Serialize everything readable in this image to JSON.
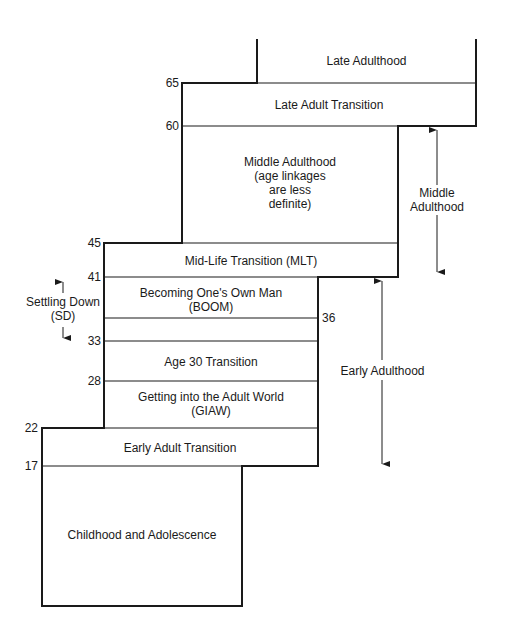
{
  "diagram": {
    "ages": {
      "a65": "65",
      "a60": "60",
      "a45": "45",
      "a41": "41",
      "a36": "36",
      "a33": "33",
      "a28": "28",
      "a22": "22",
      "a17": "17"
    },
    "periods": {
      "late_adulthood": "Late Adulthood",
      "late_adult_transition": "Late Adult Transition",
      "middle_adulthood_l1": "Middle Adulthood",
      "middle_adulthood_l2": "(age linkages",
      "middle_adulthood_l3": "are less",
      "middle_adulthood_l4": "definite)",
      "mid_life_transition": "Mid-Life Transition (MLT)",
      "boom_l1": "Becoming One's Own Man",
      "boom_l2": "(BOOM)",
      "age30_transition": "Age 30 Transition",
      "giaw_l1": "Getting into the Adult World",
      "giaw_l2": "(GIAW)",
      "early_adult_transition": "Early Adult Transition",
      "childhood": "Childhood and Adolescence"
    },
    "eras": {
      "settling_down_l1": "Settling Down",
      "settling_down_l2": "(SD)",
      "middle_adulthood_l1": "Middle",
      "middle_adulthood_l2": "Adulthood",
      "early_adulthood": "Early Adulthood"
    },
    "colors": {
      "line": "#1a1a1a",
      "background": "#ffffff"
    }
  }
}
